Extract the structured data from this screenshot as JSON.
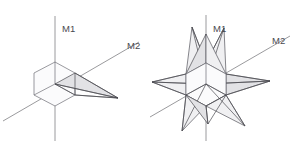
{
  "figure": {
    "background_color": "#ffffff",
    "line_color": "#4a4a50",
    "axis_color": "#8e8e92",
    "face_fill_light": "#f0f0f2",
    "face_fill_dark": "#e2e2e5",
    "panels": [
      {
        "id": "left-panel",
        "name": "single-spike-figure",
        "description": "isometric hexagonal cube outline with one spike extending to the right",
        "core": {
          "type": "hexagon-cube",
          "center": [
            55,
            84
          ],
          "vertices": [
            [
              55,
              62
            ],
            [
              75,
              73
            ],
            [
              75,
              95
            ],
            [
              55,
              106
            ],
            [
              34,
              95
            ],
            [
              34,
              73
            ]
          ],
          "inner_vertex": [
            55,
            84
          ]
        },
        "spikes": [
          {
            "name": "spike-right",
            "tip": [
              118,
              98
            ],
            "base": [
              [
                75,
                73
              ],
              [
                75,
                95
              ],
              [
                55,
                84
              ]
            ]
          }
        ],
        "axes": [
          {
            "name": "axis-m1",
            "label": "M1",
            "label_pos": [
              62,
              32
            ],
            "orientation": "vertical",
            "x1": 55,
            "y1": 16,
            "x2": 55,
            "y2": 141
          },
          {
            "name": "axis-m2",
            "label": "M2",
            "label_pos": [
              127,
              49
            ],
            "orientation": "diagonal",
            "x1": 3,
            "y1": 121,
            "x2": 139,
            "y2": 42
          }
        ]
      },
      {
        "id": "right-panel",
        "name": "eight-spike-star-figure",
        "description": "isometric hexagonal cube core with eight spikes radiating outward forming a star",
        "core": {
          "type": "hexagon-cube",
          "center": [
            206,
            84
          ],
          "vertices": [
            [
              206,
              63
            ],
            [
              226,
              74
            ],
            [
              226,
              95
            ],
            [
              206,
              106
            ],
            [
              186,
              95
            ],
            [
              186,
              74
            ]
          ],
          "inner_vertex": [
            206,
            84
          ]
        },
        "spikes": [
          {
            "name": "spike-up-left",
            "tip": [
              192,
              27
            ]
          },
          {
            "name": "spike-up-right",
            "tip": [
              224,
              28
            ]
          },
          {
            "name": "spike-right",
            "tip": [
              270,
              81
            ]
          },
          {
            "name": "spike-left",
            "tip": [
              152,
              82
            ]
          },
          {
            "name": "spike-down-left",
            "tip": [
              182,
              131
            ]
          },
          {
            "name": "spike-down-right",
            "tip": [
              245,
              126
            ]
          },
          {
            "name": "spike-upper-far",
            "tip": [
              206,
              34
            ]
          },
          {
            "name": "spike-lower-far",
            "tip": [
              208,
              124
            ]
          }
        ],
        "axes": [
          {
            "name": "axis-m1",
            "label": "M1",
            "label_pos": [
              213,
              32
            ],
            "orientation": "vertical",
            "x1": 206,
            "y1": 15,
            "x2": 206,
            "y2": 141
          },
          {
            "name": "axis-m2",
            "label": "M2",
            "label_pos": [
              272,
              44
            ],
            "orientation": "diagonal",
            "x1": 150,
            "y1": 117,
            "x2": 290,
            "y2": 36
          }
        ]
      }
    ]
  },
  "labels": {
    "m1": "M1",
    "m2": "M2"
  }
}
